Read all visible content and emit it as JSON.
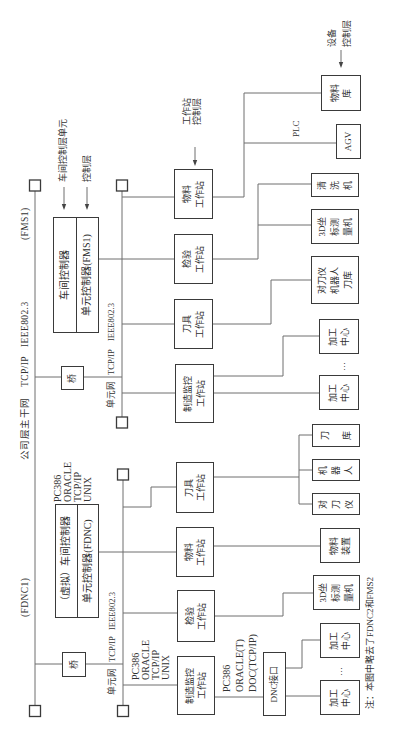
{
  "backbone": {
    "tag_fdnc": "(FDNC1)",
    "network_name": "公司层主干网",
    "protocol": "TCP/IP",
    "standard": "IEEE802.3",
    "tag_fms": "(FMS1)"
  },
  "layers": {
    "shop_unit": [
      "车间控制层单元",
      "控制层"
    ],
    "workstation": [
      "工作站",
      "控制层"
    ],
    "device": [
      "设备",
      "控制层"
    ]
  },
  "fms1": {
    "bridge": "桥",
    "unit_net": {
      "name": "单元网",
      "protocol": "TCP/IP",
      "standard": "IEEE802.3"
    },
    "controller": {
      "shop": "车间控制器",
      "cell": "单元控制器(FMS1)"
    },
    "workstations": [
      {
        "lines": [
          "制造监控",
          "工作站"
        ]
      },
      {
        "lines": [
          "刀具",
          "工作站"
        ]
      },
      {
        "lines": [
          "检验",
          "工作站"
        ]
      },
      {
        "lines": [
          "物料",
          "工作站"
        ]
      }
    ],
    "devices": [
      {
        "lines": [
          "加工",
          "中心"
        ]
      },
      {
        "lines": [
          "加工",
          "中心"
        ]
      },
      {
        "lines": [
          "对刀仪",
          "机器人",
          "刀库"
        ]
      },
      {
        "lines": [
          "3D坐",
          "标测",
          "量机"
        ]
      },
      {
        "lines": [
          "清",
          "洗",
          "机"
        ]
      },
      {
        "lines": [
          "AGV"
        ]
      },
      {
        "lines": [
          "物料",
          "库"
        ]
      }
    ],
    "plc_label": "PLC",
    "ellipsis": "…"
  },
  "fdnc1": {
    "bridge": "桥",
    "unit_net": {
      "name": "单元网",
      "protocol": "TCP/IP",
      "standard": "IEEE802.3"
    },
    "controller": {
      "shop": "（虚拟）车间控制器",
      "cell": "单元控制器(FDNC)"
    },
    "controller_spec": [
      "PC386",
      "ORACLE",
      "TCP/IP",
      "UNIX"
    ],
    "workstations": [
      {
        "lines": [
          "制造监控",
          "工作站"
        ]
      },
      {
        "lines": [
          "检验",
          "工作站"
        ]
      },
      {
        "lines": [
          "物料",
          "工作站"
        ]
      },
      {
        "lines": [
          "刀具",
          "工作站"
        ]
      }
    ],
    "monitor_spec": [
      "PC386",
      "ORACLE",
      "TCP/IP",
      "UNIX"
    ],
    "dnc_spec": [
      "PC386",
      "ORACLE(T)",
      "DOC(TCP/IP)"
    ],
    "dnc_interface": "DNC接口",
    "devices": [
      {
        "lines": [
          "加工",
          "中心"
        ]
      },
      {
        "lines": [
          "加工",
          "中心"
        ]
      },
      {
        "lines": [
          "3D坐",
          "标测",
          "量机"
        ]
      },
      {
        "lines": [
          "物料",
          "装置"
        ]
      },
      {
        "lines": [
          "对",
          "刀",
          "仪"
        ]
      },
      {
        "lines": [
          "机",
          "器",
          "人"
        ]
      },
      {
        "lines": [
          "刀",
          "库"
        ]
      }
    ],
    "ellipsis": "…"
  },
  "note": "注：本图中略去了FDNC2和FMS2"
}
